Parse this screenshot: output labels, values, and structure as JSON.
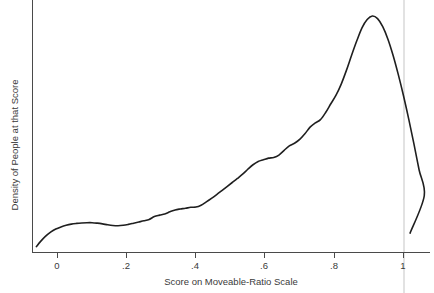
{
  "chart_data": {
    "type": "line",
    "title": "",
    "subtitle": "",
    "xlabel": "Score on Moveable-Ratio Scale",
    "ylabel": "Density of People at that Score",
    "xlim": [
      -0.06,
      0.09
    ],
    "xlim_note": "axis spans about -0.06 to 1.09",
    "ylim": [
      0,
      1.0
    ],
    "grid": false,
    "legend": null,
    "legend_position": "none",
    "x_ticks": [
      {
        "value": 0,
        "label": "0"
      },
      {
        "value": 0.2,
        "label": ".2"
      },
      {
        "value": 0.4,
        "label": ".4"
      },
      {
        "value": 0.6,
        "label": ".6"
      },
      {
        "value": 0.8,
        "label": ".8"
      },
      {
        "value": 1,
        "label": "1"
      }
    ],
    "y_ticks": [],
    "reference_line_x": 1,
    "curve_color": "#1f1f1f",
    "annotations": [],
    "series": [
      {
        "name": "Density of People at that Score",
        "x": [
          -0.061,
          -0.05,
          -0.035,
          -0.02,
          -0.005,
          0.01,
          0.025,
          0.04,
          0.055,
          0.07,
          0.085,
          0.1,
          0.115,
          0.13,
          0.145,
          0.16,
          0.175,
          0.19,
          0.205,
          0.22,
          0.235,
          0.25,
          0.265,
          0.28,
          0.295,
          0.31,
          0.325,
          0.34,
          0.355,
          0.37,
          0.385,
          0.4,
          0.415,
          0.43,
          0.445,
          0.46,
          0.475,
          0.49,
          0.505,
          0.52,
          0.535,
          0.55,
          0.565,
          0.58,
          0.595,
          0.61,
          0.625,
          0.64,
          0.655,
          0.67,
          0.685,
          0.7,
          0.715,
          0.73,
          0.745,
          0.76,
          0.775,
          0.79,
          0.805,
          0.82,
          0.835,
          0.85,
          0.865,
          0.88,
          0.895,
          0.91,
          0.925,
          0.94,
          0.955,
          0.97,
          0.985,
          1.0,
          1.015,
          1.03,
          1.045,
          1.06,
          1.019
        ],
        "y": [
          0.025,
          0.045,
          0.068,
          0.086,
          0.099,
          0.108,
          0.115,
          0.12,
          0.123,
          0.125,
          0.126,
          0.126,
          0.124,
          0.121,
          0.117,
          0.114,
          0.113,
          0.115,
          0.119,
          0.124,
          0.129,
          0.134,
          0.14,
          0.152,
          0.158,
          0.163,
          0.172,
          0.18,
          0.184,
          0.187,
          0.191,
          0.192,
          0.2,
          0.214,
          0.229,
          0.245,
          0.262,
          0.279,
          0.296,
          0.313,
          0.331,
          0.352,
          0.371,
          0.385,
          0.392,
          0.399,
          0.402,
          0.412,
          0.432,
          0.451,
          0.462,
          0.478,
          0.502,
          0.53,
          0.548,
          0.562,
          0.592,
          0.629,
          0.665,
          0.712,
          0.77,
          0.834,
          0.895,
          0.95,
          0.985,
          1.0,
          0.989,
          0.955,
          0.902,
          0.833,
          0.752,
          0.663,
          0.565,
          0.46,
          0.35,
          0.24,
          0.082
        ]
      }
    ]
  },
  "labels": {
    "x_axis_title": "Score on Moveable-Ratio Scale",
    "y_axis_title": "Density of People at that Score"
  },
  "icons": {
    "chart_icon": "line-chart-icon"
  }
}
